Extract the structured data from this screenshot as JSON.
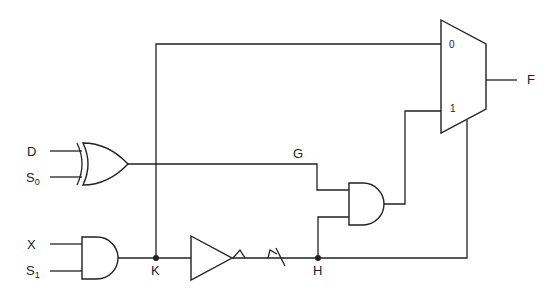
{
  "diagram": {
    "type": "logic-circuit",
    "stroke_color": "#222222",
    "background": "#ffffff",
    "inputs": [
      {
        "id": "D",
        "label": "D",
        "subscript": ""
      },
      {
        "id": "S0",
        "label": "S",
        "subscript": "0"
      },
      {
        "id": "X",
        "label": "X",
        "subscript": ""
      },
      {
        "id": "S1",
        "label": "S",
        "subscript": "1"
      }
    ],
    "output": {
      "id": "F",
      "label": "F"
    },
    "nodes": {
      "G": {
        "label": "G"
      },
      "K": {
        "label": "K"
      },
      "H": {
        "label": "H"
      }
    },
    "mux": {
      "pin0": "0",
      "pin1": "1"
    },
    "gates": [
      {
        "id": "xor1",
        "type": "XOR",
        "inputs": [
          "D",
          "S0"
        ],
        "output": "G"
      },
      {
        "id": "and1",
        "type": "AND",
        "inputs": [
          "X",
          "S1"
        ],
        "output": "K"
      },
      {
        "id": "buf1",
        "type": "BUFFER",
        "inputs": [
          "K"
        ],
        "output": "H"
      },
      {
        "id": "and2",
        "type": "AND",
        "inputs": [
          "G",
          "H"
        ],
        "output": "mux.in1"
      },
      {
        "id": "mux1",
        "type": "MUX2",
        "inputs": [
          "K",
          "and2"
        ],
        "select": "H",
        "output": "F"
      }
    ]
  }
}
